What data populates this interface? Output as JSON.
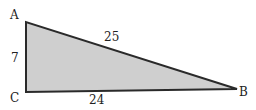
{
  "diagram": {
    "type": "right-triangle",
    "fill_color": "#cfcfcf",
    "stroke_color": "#2a2a2a",
    "vertices": [
      {
        "name": "A",
        "x": 26,
        "y": 22
      },
      {
        "name": "C",
        "x": 26,
        "y": 92
      },
      {
        "name": "B",
        "x": 237,
        "y": 89
      }
    ],
    "labels": {
      "A": "A",
      "B": "B",
      "C": "C",
      "side_AC": "7",
      "side_AB": "25",
      "side_CB": "24"
    }
  }
}
